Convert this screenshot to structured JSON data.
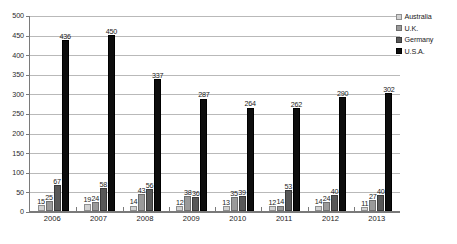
{
  "chart_data": {
    "type": "bar",
    "title": "",
    "subtitle": "",
    "xlabel": "",
    "ylabel": "",
    "categories": [
      "2006",
      "2007",
      "2008",
      "2009",
      "2010",
      "2011",
      "2012",
      "2013"
    ],
    "series": [
      {
        "name": "Australia",
        "color": "#d2d2d2",
        "values": [
          15,
          19,
          14,
          12,
          13,
          12,
          14,
          11
        ]
      },
      {
        "name": "U.K.",
        "color": "#9a9a9a",
        "values": [
          25,
          24,
          43,
          38,
          35,
          14,
          24,
          27
        ]
      },
      {
        "name": "Germany",
        "color": "#585858",
        "values": [
          67,
          58,
          56,
          36,
          39,
          53,
          40,
          40
        ]
      },
      {
        "name": "U.S.A.",
        "color": "#0d0d0d",
        "values": [
          436,
          450,
          337,
          287,
          264,
          262,
          290,
          302
        ]
      }
    ],
    "ylim": [
      0,
      500
    ],
    "yticks": [
      0,
      50,
      100,
      150,
      200,
      250,
      300,
      350,
      400,
      450,
      500
    ],
    "ytick_labels": [
      "0",
      "50",
      "100",
      "150",
      "200",
      "250",
      "300",
      "350",
      "400",
      "450",
      "500"
    ],
    "grid": true,
    "grid_axis": "y",
    "legend_position": "top-right",
    "data_labels": true,
    "bar_mode": "grouped"
  },
  "legend": {
    "items": [
      {
        "label": "Australia"
      },
      {
        "label": "U.K."
      },
      {
        "label": "Germany"
      },
      {
        "label": "U.S.A."
      }
    ]
  }
}
